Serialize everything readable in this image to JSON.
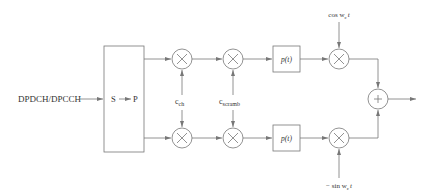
{
  "diagram": {
    "type": "block-diagram",
    "input": {
      "label": "DPDCH/DPCCH"
    },
    "serial_to_parallel": {
      "left": "S",
      "right": "P"
    },
    "codes": {
      "channelization": "c",
      "channelization_sub": "ch",
      "scrambling": "c",
      "scrambling_sub": "scramb"
    },
    "pulse_shaping": {
      "top": "p(t)",
      "bottom": "p(t)"
    },
    "carriers": {
      "top": "cos w",
      "top_sub": "c",
      "top_tail": "t",
      "bottom": "− sin w",
      "bottom_sub": "c",
      "bottom_tail": "t"
    },
    "multiplier_symbol": "×",
    "adder_symbol": "+",
    "colors": {
      "line": "#777777",
      "text": "#333333",
      "background": "#ffffff"
    }
  }
}
